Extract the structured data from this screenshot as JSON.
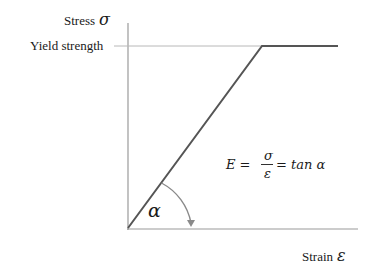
{
  "diagram": {
    "type": "stress-strain-elastic-perfectly-plastic",
    "y_axis": {
      "label": "Stress",
      "symbol": "σ"
    },
    "x_axis": {
      "label": "Strain",
      "symbol": "ε"
    },
    "yield_label": "Yield strength",
    "angle_symbol": "α",
    "formula": {
      "lhs": "E =",
      "numerator": "σ",
      "denominator": "ε",
      "rhs": "= tan α"
    },
    "colors": {
      "curve": "#555555",
      "axes": "#9a9a9a",
      "yield_line": "#b0b0b0"
    }
  }
}
